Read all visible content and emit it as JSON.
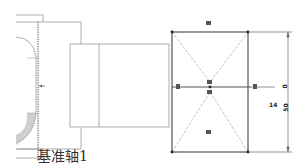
{
  "viewport": {
    "background": "#ffffff",
    "line_color": "#888888",
    "sketch_color": "#555555"
  },
  "datum_axis": {
    "label": "基准轴1"
  },
  "dimensions": {
    "horizontal_offset": "14",
    "vertical_offset": "0",
    "vertical_height": "50"
  },
  "sketch": {
    "constraint_glyphs": [
      "horizontal-constraint-top",
      "horizontal-constraint-bottom",
      "vertical-constraint-left",
      "vertical-constraint-right",
      "coincident-constraint-center-1",
      "coincident-constraint-center-2"
    ]
  }
}
